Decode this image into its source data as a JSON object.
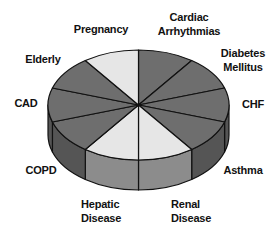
{
  "chart_data": {
    "type": "pie",
    "style": "3d",
    "title": "",
    "start_angle_deg": 0,
    "direction": "clockwise",
    "categories": [
      "Cardiac Arrhythmias",
      "Diabetes Mellitus",
      "CHF",
      "Asthma",
      "Renal Disease",
      "Hepatic Disease",
      "COPD",
      "CAD",
      "Elderly",
      "Pregnancy"
    ],
    "values": [
      10,
      10,
      10,
      10,
      10,
      10,
      10,
      10,
      10,
      10
    ],
    "shade": [
      "dark",
      "dark",
      "dark",
      "dark",
      "light",
      "light",
      "dark",
      "dark",
      "dark",
      "light"
    ],
    "legend": "none (labels placed around pie)"
  },
  "colors": {
    "top_dark": "#6e6e6e",
    "top_light": "#e6e6e6",
    "wall_dark": "#3c3c3c",
    "wall_dark_edge": "#555555",
    "wall_light": "#8c8c8c",
    "outline": "#111111"
  },
  "geometry": {
    "cx": 138.5,
    "cy": 105,
    "rx": 90.5,
    "ry": 55,
    "depth": 30
  },
  "labels": [
    {
      "lines": [
        "Cardiac",
        "Arrhythmias"
      ],
      "x": 189,
      "y": 21,
      "anchor": "middle"
    },
    {
      "lines": [
        "Diabetes",
        "Mellitus"
      ],
      "x": 243,
      "y": 57,
      "anchor": "middle"
    },
    {
      "lines": [
        "CHF"
      ],
      "x": 253,
      "y": 108,
      "anchor": "middle"
    },
    {
      "lines": [
        "Asthma"
      ],
      "x": 243,
      "y": 174,
      "anchor": "middle"
    },
    {
      "lines": [
        "Renal",
        "Disease"
      ],
      "x": 171,
      "y": 208,
      "anchor": "start"
    },
    {
      "lines": [
        "Hepatic",
        "Disease"
      ],
      "x": 81,
      "y": 208,
      "anchor": "start"
    },
    {
      "lines": [
        "COPD"
      ],
      "x": 41,
      "y": 174,
      "anchor": "middle"
    },
    {
      "lines": [
        "CAD"
      ],
      "x": 26,
      "y": 107,
      "anchor": "middle"
    },
    {
      "lines": [
        "Elderly"
      ],
      "x": 43,
      "y": 63,
      "anchor": "middle"
    },
    {
      "lines": [
        "Pregnancy"
      ],
      "x": 101,
      "y": 33,
      "anchor": "middle"
    }
  ]
}
